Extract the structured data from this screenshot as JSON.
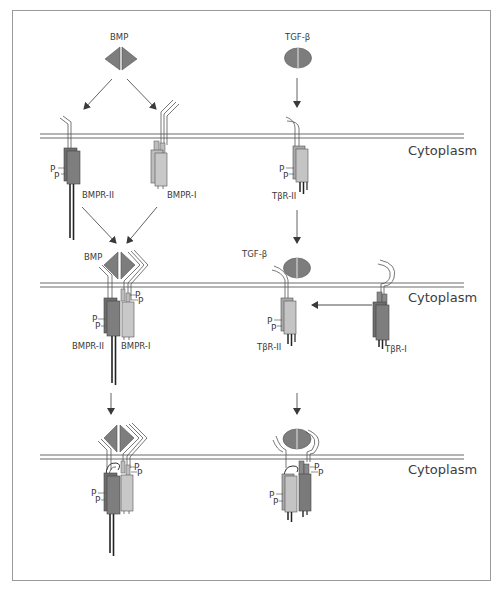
{
  "figure": {
    "colors": {
      "frame": "#9a9a9a",
      "membrane": "#6a6a6a",
      "ligand": "#7d7d7d",
      "receptor_dark": "#7a7a7a",
      "receptor_light": "#c4c4c4",
      "arrow": "#3a3a3a"
    },
    "left_panel": {
      "ligand_label_top": "BMP",
      "receptor_type2_label": "BMPR-II",
      "receptor_type1_label": "BMPR-I",
      "ligand_label_mid": "BMP",
      "receptor_type2_label_mid": "BMPR-II",
      "receptor_type1_label_mid": "BMPR-I"
    },
    "right_panel": {
      "ligand_label_top": "TGF-β",
      "receptor_type2_label": "TβR-II",
      "ligand_label_mid": "TGF-β",
      "receptor_type2_label_mid": "TβR-II",
      "receptor_type1_label_mid": "TβR-I"
    },
    "membrane_labels": [
      "Cytoplasm",
      "Cytoplasm",
      "Cytoplasm"
    ],
    "phospho_label": "P"
  }
}
